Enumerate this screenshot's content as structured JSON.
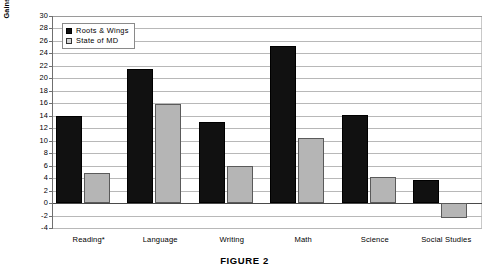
{
  "caption": "FIGURE 2",
  "chart_data": {
    "type": "bar",
    "title": "",
    "xlabel": "",
    "ylabel": "Gains in percent satisfactory or excellent",
    "ylim": [
      -4,
      30
    ],
    "ytick_step": 2,
    "yticks": [
      30,
      28,
      26,
      24,
      22,
      20,
      18,
      16,
      14,
      12,
      10,
      8,
      6,
      4,
      2,
      0,
      -2,
      -4
    ],
    "grid": true,
    "legend_position": "top-left-inside",
    "categories": [
      "Reading*",
      "Language",
      "Writing",
      "Math",
      "Science",
      "Social Studies"
    ],
    "series": [
      {
        "name": "Roots & Wings",
        "color": "#111111",
        "values": [
          14.0,
          21.5,
          13.0,
          25.2,
          14.2,
          3.7
        ]
      },
      {
        "name": "State of MD",
        "color": "#b5b5b5",
        "values": [
          4.8,
          15.9,
          6.0,
          10.4,
          4.1,
          -2.4
        ]
      }
    ]
  }
}
